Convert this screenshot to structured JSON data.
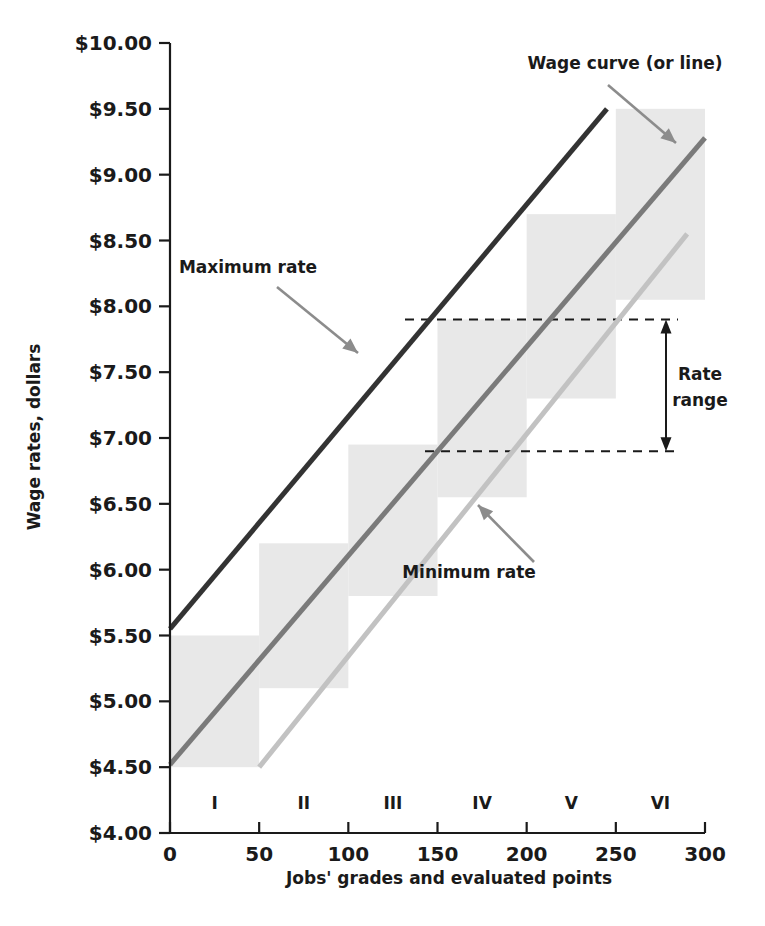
{
  "chart_data": {
    "type": "line",
    "title": "",
    "xlabel": "Jobs' grades and evaluated points",
    "ylabel": "Wage rates, dollars",
    "xlim": [
      0,
      300
    ],
    "ylim": [
      4.0,
      10.0
    ],
    "grid": false,
    "legend": "none",
    "x_ticks": [
      0,
      50,
      100,
      150,
      200,
      250,
      300
    ],
    "x_tick_labels": [
      "0",
      "50",
      "100",
      "150",
      "200",
      "250",
      "300"
    ],
    "y_ticks": [
      4.0,
      4.5,
      5.0,
      5.5,
      6.0,
      6.5,
      7.0,
      7.5,
      8.0,
      8.5,
      9.0,
      9.5,
      10.0
    ],
    "y_tick_labels": [
      "$4.00",
      "$4.50",
      "$5.00",
      "$5.50",
      "$6.00",
      "$6.50",
      "$7.00",
      "$7.50",
      "$8.00",
      "$8.50",
      "$9.00",
      "$9.50",
      "$10.00"
    ],
    "grade_bands": [
      {
        "label": "I",
        "x_start": 0,
        "x_end": 50,
        "y_bottom": 4.5,
        "y_top": 5.5
      },
      {
        "label": "II",
        "x_start": 50,
        "x_end": 100,
        "y_bottom": 5.1,
        "y_top": 6.2
      },
      {
        "label": "III",
        "x_start": 100,
        "x_end": 150,
        "y_bottom": 5.8,
        "y_top": 6.95
      },
      {
        "label": "IV",
        "x_start": 150,
        "x_end": 200,
        "y_bottom": 6.55,
        "y_top": 7.9
      },
      {
        "label": "V",
        "x_start": 200,
        "x_end": 250,
        "y_bottom": 7.3,
        "y_top": 8.7
      },
      {
        "label": "VI",
        "x_start": 250,
        "x_end": 300,
        "y_bottom": 8.05,
        "y_top": 9.5
      }
    ],
    "series": [
      {
        "name": "Maximum rate",
        "color": "#333333",
        "width": 5,
        "points": [
          [
            0,
            5.55
          ],
          [
            245,
            9.5
          ]
        ]
      },
      {
        "name": "Wage curve (or line)",
        "color": "#7a7a7a",
        "width": 5,
        "points": [
          [
            0,
            4.52
          ],
          [
            300,
            9.28
          ]
        ]
      },
      {
        "name": "Minimum rate",
        "color": "#c2c2c2",
        "width": 5,
        "points": [
          [
            50,
            4.5
          ],
          [
            290,
            8.55
          ]
        ]
      }
    ],
    "annotations": [
      {
        "id": "wage-curve",
        "text": "Wage curve (or line)",
        "text_x": 625,
        "text_y": 69
      },
      {
        "id": "maximum-rate",
        "text": "Maximum rate",
        "text_x": 248,
        "text_y": 273
      },
      {
        "id": "minimum-rate",
        "text": "Minimum rate",
        "text_x": 469,
        "text_y": 578
      },
      {
        "id": "rate-range-line1",
        "text": "Rate",
        "text_x": 700,
        "text_y": 380
      },
      {
        "id": "rate-range-line2",
        "text": "range",
        "text_x": 700,
        "text_y": 406
      }
    ],
    "rate_range": {
      "label_line_1": "Rate",
      "label_line_2": "range",
      "upper_value": 7.9,
      "lower_value": 6.9
    },
    "band_fill_color": "#e8e8e8"
  }
}
